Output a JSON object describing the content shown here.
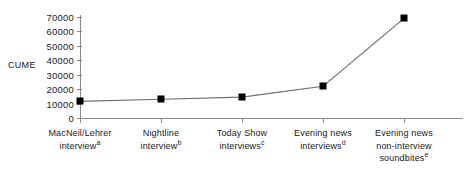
{
  "chart_data": {
    "type": "line",
    "title": "",
    "xlabel": "",
    "ylabel": "CUME",
    "categories": [
      "MacNeil/Lehrer interview",
      "Nightline interview",
      "Today Show interviews",
      "Evening news interviews",
      "Evening news non-interview soundbites"
    ],
    "category_footnotes": [
      "a",
      "b",
      "c",
      "d",
      "e"
    ],
    "category_lines": [
      [
        "MacNeil/Lehrer",
        "interview"
      ],
      [
        "Nightline",
        "interview"
      ],
      [
        "Today Show",
        "interviews"
      ],
      [
        "Evening news",
        "interviews"
      ],
      [
        "Evening news",
        "non-interview",
        "soundbites"
      ]
    ],
    "values": [
      11500,
      13000,
      14500,
      22000,
      69000
    ],
    "ylim": [
      0,
      70000
    ],
    "ytick_values": [
      0,
      10000,
      20000,
      30000,
      40000,
      50000,
      60000,
      70000
    ],
    "ytick_labels": [
      "0",
      "10000",
      "20000",
      "30000",
      "40000",
      "50000",
      "60000",
      "70000"
    ],
    "grid": false,
    "legend": "none",
    "marker": "square",
    "marker_color": "#000000",
    "line_color": "#6e6e6e",
    "axis_color": "#8a8a8a"
  }
}
